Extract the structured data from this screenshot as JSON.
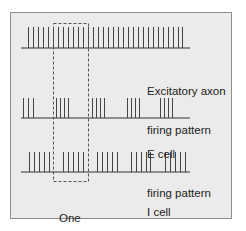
{
  "diagram": {
    "colors": {
      "background": "#ebebeb",
      "frame": "#8e8e8e",
      "spike": "#444444",
      "baseline": "#333333",
      "dash": "#555555"
    },
    "rows": [
      {
        "name": "excitatory-axon",
        "label_line1": "Excitatory axon",
        "label_line2": "firing pattern",
        "baseline_y": 48,
        "spike_top": 27,
        "x_start": 21,
        "x_end": 190,
        "spikes": [
          28,
          33,
          38,
          43,
          48,
          53,
          58,
          63,
          68,
          73,
          78,
          83,
          88,
          93,
          98,
          103,
          108,
          113,
          118,
          123,
          128,
          133,
          138,
          143,
          148,
          153,
          158,
          163,
          168,
          173,
          178,
          182
        ]
      },
      {
        "name": "e-cell",
        "label_line1": "E cell",
        "label_line2": "firing pattern",
        "baseline_y": 118,
        "spike_top": 98,
        "x_start": 21,
        "x_end": 190,
        "spikes": [
          23,
          28,
          33,
          56,
          60,
          64,
          68,
          92,
          96,
          100,
          104,
          127,
          131,
          135,
          139,
          160,
          164,
          168,
          172
        ]
      },
      {
        "name": "i-cell",
        "label_line1": "I cell",
        "label_line2": "firing pattern",
        "baseline_y": 172,
        "spike_top": 152,
        "x_start": 21,
        "x_end": 190,
        "spikes": [
          29,
          34,
          39,
          44,
          49,
          63,
          68,
          73,
          78,
          83,
          97,
          102,
          107,
          112,
          117,
          131,
          136,
          141,
          146,
          150,
          165,
          170,
          175,
          180,
          185
        ]
      }
    ],
    "cycle_box": {
      "label_line1": "One",
      "label_line2": "cycle",
      "x1": 53,
      "x2": 88,
      "y1": 23,
      "y2": 181
    }
  }
}
